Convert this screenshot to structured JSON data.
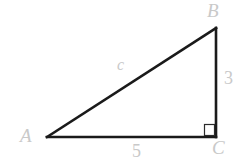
{
  "figure": {
    "type": "right-triangle-diagram",
    "background_color": "#ffffff",
    "stroke_color": "#1a1a1a",
    "label_color": "#c9c9c9",
    "width": 245,
    "height": 158
  },
  "vertices": {
    "A": {
      "label": "A",
      "x": 47,
      "y": 137
    },
    "B": {
      "label": "B",
      "x": 216,
      "y": 28
    },
    "C": {
      "label": "C",
      "x": 216,
      "y": 137
    }
  },
  "sides": {
    "hypotenuse": {
      "label": "c",
      "from": "A",
      "to": "B"
    },
    "vertical": {
      "label": "3",
      "from": "B",
      "to": "C"
    },
    "base": {
      "label": "5",
      "from": "A",
      "to": "C"
    }
  },
  "markers": {
    "right_angle": {
      "at_vertex": "C",
      "name": "right-angle-square",
      "size": 10
    }
  }
}
